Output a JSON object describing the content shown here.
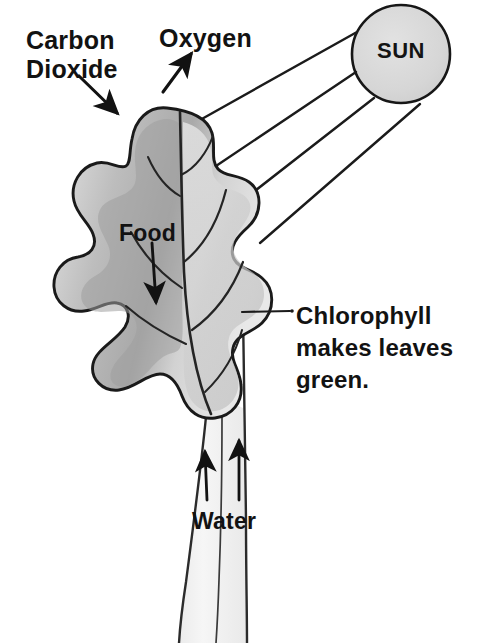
{
  "diagram": {
    "background_color": "#ffffff",
    "ink_color": "#121212",
    "labels": {
      "carbon_dioxide": "Carbon\nDioxide",
      "oxygen": "Oxygen",
      "food": "Food",
      "water": "Water",
      "sun": "SUN",
      "chlorophyll": "Chlorophyll\nmakes leaves\ngreen."
    },
    "sun": {
      "label": "SUN",
      "fill_color": "#d9d9d9",
      "outline_color": "#171717",
      "center_x": 401,
      "center_y": 54,
      "radius": 49,
      "ray_count": 4
    },
    "leaf": {
      "shape": "lobed oak leaf",
      "light_fill": "#e3e3e3",
      "mid_fill": "#c9c9c9",
      "shadow_fill": "#a6a6a6",
      "outline_color": "#1a1a1a",
      "vein_color": "#2a2a2a"
    },
    "stem": {
      "fill_color": "#f2f2f2",
      "outline_color": "#2b2b2b",
      "water_arrow_count": 2
    },
    "arrows": [
      {
        "name": "carbon-dioxide-arrow",
        "direction": "down-right"
      },
      {
        "name": "oxygen-arrow",
        "direction": "up-right"
      },
      {
        "name": "food-arrow",
        "direction": "down"
      },
      {
        "name": "water-arrow-left",
        "direction": "up"
      },
      {
        "name": "water-arrow-right",
        "direction": "up"
      }
    ],
    "leader_lines": [
      {
        "name": "chlorophyll-leader",
        "orientation": "horizontal"
      }
    ]
  }
}
